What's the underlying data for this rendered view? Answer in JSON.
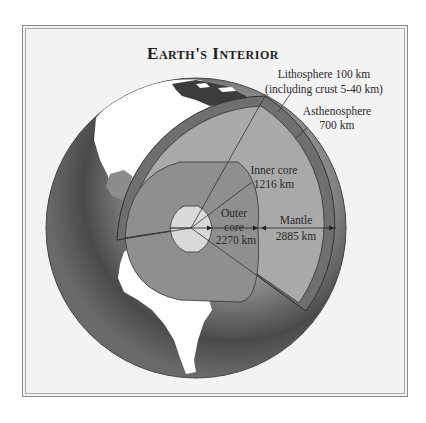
{
  "title": "Earth's Interior",
  "labels": {
    "lithosphere_line1": "Lithosphere 100 km",
    "lithosphere_line2": "(including crust 5-40 km)",
    "asthenosphere_line1": "Asthenosphere",
    "asthenosphere_line2": "700 km",
    "inner_core_line1": "Inner core",
    "inner_core_line2": "1216 km",
    "outer_core_line1": "Outer",
    "outer_core_line2": "core",
    "outer_core_line3": "2270 km",
    "mantle_line1": "Mantle",
    "mantle_line2": "2885 km"
  },
  "layers": [
    {
      "name": "Inner core",
      "thickness_km": 1216,
      "color": "#d9d9d9"
    },
    {
      "name": "Outer core",
      "thickness_km": 2270,
      "color": "#8f8f8f"
    },
    {
      "name": "Mantle",
      "thickness_km": 2885,
      "color": "#a9a9a9"
    },
    {
      "name": "Asthenosphere",
      "thickness_km": 700,
      "color": "#a9a9a9"
    },
    {
      "name": "Lithosphere",
      "thickness_km": 100,
      "note": "including crust 5-40 km",
      "color": "#6f6f6f"
    }
  ],
  "colors": {
    "frame_bg": "#f3f3f3",
    "ocean_dark": "#3a3a3a",
    "ocean_light": "#b8b8b8",
    "land": "#ffffff",
    "outline": "#333333"
  }
}
